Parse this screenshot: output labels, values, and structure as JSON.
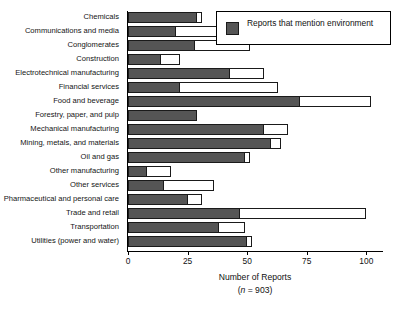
{
  "chart_data": {
    "type": "bar",
    "orientation": "horizontal",
    "title": "",
    "xlabel": "Number of Reports",
    "xlabel_note": "(n = 903)",
    "ylabel": "",
    "xlim": [
      0,
      107
    ],
    "xticks": [
      0,
      25,
      50,
      75,
      100
    ],
    "grid": false,
    "legend_position": "top-right",
    "legend": [
      {
        "label": "Reports that mention environment",
        "color": "#555555"
      }
    ],
    "categories": [
      "Chemicals",
      "Communications and media",
      "Conglomerates",
      "Construction",
      "Electrotechnical manufacturing",
      "Financial services",
      "Food and beverage",
      "Forestry, paper, and pulp",
      "Mechanical manufacturing",
      "Mining, metals, and materials",
      "Oil and gas",
      "Other manufacturing",
      "Other services",
      "Pharmaceutical and personal care",
      "Trade and retail",
      "Transportation",
      "Utilities (power and water)"
    ],
    "series": [
      {
        "name": "Total reports",
        "values": [
          31,
          43,
          51,
          22,
          57,
          63,
          102,
          29,
          67,
          64,
          51,
          18,
          36,
          31,
          100,
          49,
          52
        ]
      },
      {
        "name": "Reports that mention environment",
        "values": [
          29,
          20,
          28,
          14,
          43,
          22,
          72,
          29,
          57,
          60,
          49,
          8,
          15,
          25,
          47,
          38,
          50
        ]
      }
    ]
  },
  "axis": {
    "tick_labels": [
      "0",
      "25",
      "50",
      "75",
      "100"
    ],
    "title": "Number of Reports",
    "subtitle_prefix": "(",
    "subtitle_italic": "n",
    "subtitle_suffix": " = 903)"
  },
  "legend": {
    "label": "Reports that mention environment"
  }
}
